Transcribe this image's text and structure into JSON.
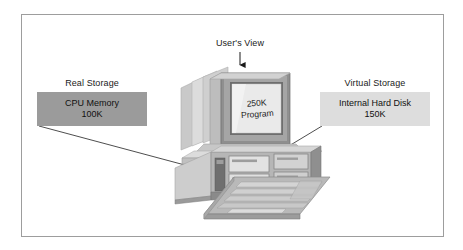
{
  "figure": {
    "border_color": "#9d9d9d",
    "background": "#ffffff"
  },
  "labels": {
    "real_storage": "Real Storage",
    "virtual_storage": "Virtual Storage",
    "users_view": "User's View"
  },
  "boxes": {
    "real": {
      "line1": "CPU Memory",
      "line2": "100K",
      "fill": "#9b9b9b"
    },
    "virtual": {
      "line1": "Internal Hard Disk",
      "line2": "150K",
      "fill": "#dddddd"
    }
  },
  "screen": {
    "line1": "250K",
    "line2": "Program"
  },
  "icons": {
    "arrow": "down-arrow-icon",
    "computer": "desktop-computer-icon",
    "monitor": "crt-monitor-icon",
    "system_unit": "system-unit-icon",
    "keyboard": "keyboard-icon",
    "leader_left": "leader-line-real-storage",
    "leader_right": "leader-line-virtual-storage"
  },
  "palette": {
    "ink": "#1a1a1a",
    "line": "#3a3a3a",
    "case_light": "#d9d9d9",
    "case_mid": "#b4b4b4",
    "case_dark": "#8e8e8e",
    "case_shadow": "#6f6f6f",
    "screen_fill": "#e8e8e8",
    "bezel": "#a8a8a8"
  }
}
